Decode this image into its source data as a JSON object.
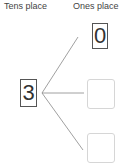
{
  "headers": {
    "tens": "Tens place",
    "ones": "Ones place"
  },
  "tens_place": {
    "value": "3"
  },
  "ones_place": {
    "boxes": [
      {
        "value": "0",
        "filled": true
      },
      {
        "value": "",
        "filled": false
      },
      {
        "value": "",
        "filled": false
      }
    ]
  },
  "colors": {
    "line": "#888888",
    "box_border": "#555555",
    "empty_box_border": "#d6d6d6"
  }
}
